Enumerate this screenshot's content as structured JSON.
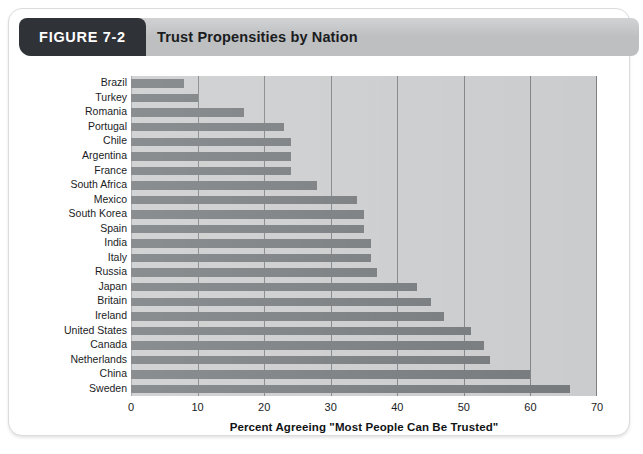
{
  "figure": {
    "tab_label": "FIGURE 7-2",
    "title": "Trust Propensities by Nation"
  },
  "colors": {
    "tab_background": "#2f3236",
    "header_band": "#bdbfc1",
    "plot_background": "#c9cbcc",
    "bar_fill": "#73777a",
    "gridline": "#7e8184",
    "text": "#1a1c1e"
  },
  "chart_data": {
    "type": "bar",
    "orientation": "horizontal",
    "title": "Trust Propensities by Nation",
    "xlabel": "Percent Agreeing \"Most People Can Be Trusted\"",
    "ylabel": "",
    "xlim": [
      0,
      70
    ],
    "xticks": [
      0,
      10,
      20,
      30,
      40,
      50,
      60,
      70
    ],
    "xtick_labels": [
      "0",
      "10",
      "20",
      "30",
      "40",
      "50",
      "60",
      "70"
    ],
    "grid": true,
    "grid_axis": "x",
    "legend": false,
    "categories": [
      "Brazil",
      "Turkey",
      "Romania",
      "Portugal",
      "Chile",
      "Argentina",
      "France",
      "South Africa",
      "Mexico",
      "South Korea",
      "Spain",
      "India",
      "Italy",
      "Russia",
      "Japan",
      "Britain",
      "Ireland",
      "United States",
      "Canada",
      "Netherlands",
      "China",
      "Sweden"
    ],
    "values": [
      8,
      10,
      17,
      23,
      24,
      24,
      24,
      28,
      34,
      35,
      35,
      36,
      36,
      37,
      43,
      45,
      47,
      51,
      53,
      54,
      60,
      66
    ]
  }
}
